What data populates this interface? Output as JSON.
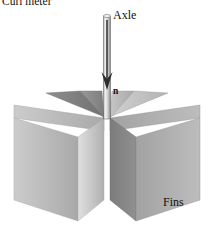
{
  "figure": {
    "title": "Curl meter",
    "labels": {
      "curl_meter": "Curl meter",
      "axle": "Axle",
      "normal_vector": "n",
      "fins": "Fins"
    },
    "colors": {
      "background": "#ffffff",
      "outline": "#4a4a4a",
      "axle_light": "#f2f2f2",
      "axle_shadow": "#8a8a8a",
      "fin_lightest": "#d8d8d8",
      "fin_light": "#bdbdbd",
      "fin_mid": "#a6a6a6",
      "fin_dark": "#8e8e8e",
      "fin_darkest": "#707070",
      "text": "#101010"
    },
    "geometry": {
      "width": 214,
      "height": 231,
      "hub_x": 107,
      "hub_y": 118,
      "axle_top_y": 14,
      "axle_bottom_y": 118,
      "axle_width": 7,
      "fin_count": 8
    }
  }
}
